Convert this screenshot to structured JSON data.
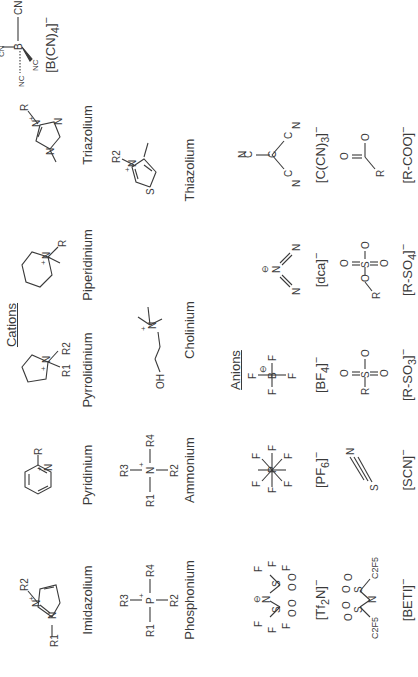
{
  "headers": {
    "cations": "Cations",
    "anions": "Anions"
  },
  "cations": {
    "row1": [
      {
        "name": "Imidazolium"
      },
      {
        "name": "Pyridinium"
      },
      {
        "name": "Pyrrolidinium"
      },
      {
        "name": "Piperidinium"
      },
      {
        "name": "Triazolium"
      }
    ],
    "row2": [
      {
        "name": "Phosphonium"
      },
      {
        "name": "Ammonium"
      },
      {
        "name": "Cholinium"
      },
      {
        "name": "Thiazolium"
      }
    ]
  },
  "anions": {
    "row1": [
      {
        "name": "[Tf2N]⁻",
        "base": "[Tf",
        "sub": "2",
        "rest": "N]",
        "sup": "−"
      },
      {
        "name": "[PF6]⁻",
        "base": "[PF",
        "sub": "6",
        "rest": "]",
        "sup": "−"
      },
      {
        "name": "[BF4]⁻",
        "base": "[BF",
        "sub": "4",
        "rest": "]",
        "sup": "−"
      },
      {
        "name": "[dca]⁻",
        "base": "[dca",
        "sub": "",
        "rest": "]",
        "sup": "−"
      },
      {
        "name": "[C(CN)3]⁻",
        "base": "[C(CN)",
        "sub": "3",
        "rest": "]",
        "sup": "−"
      },
      {
        "name": "[B(CN)4]⁻",
        "base": "[B(CN)",
        "sub": "4",
        "rest": "]",
        "sup": "−"
      }
    ],
    "row2": [
      {
        "name": "[BETI]⁻",
        "base": "[BETI",
        "sub": "",
        "rest": "]",
        "sup": "−"
      },
      {
        "name": "[SCN]⁻",
        "base": "[SCN",
        "sub": "",
        "rest": "]",
        "sup": "−"
      },
      {
        "name": "[R-SO3]⁻",
        "base": "[R-SO",
        "sub": "3",
        "rest": "]",
        "sup": "−"
      },
      {
        "name": "[R-SO4]⁻",
        "base": "[R-SO",
        "sub": "4",
        "rest": "]",
        "sup": "−"
      },
      {
        "name": "[R-COO]⁻",
        "base": "[R-COO",
        "sub": "",
        "rest": "]",
        "sup": "−"
      }
    ]
  },
  "atoms": {
    "R": "R",
    "R1": "R1",
    "R2": "R2",
    "R3": "R3",
    "R4": "R4",
    "N": "N",
    "P": "P",
    "S": "S",
    "O": "O",
    "F": "F",
    "B": "B",
    "C": "C",
    "OH": "OH",
    "CN": "CN",
    "NC": "NC",
    "C2F5": "C2F5",
    "plus": "+",
    "minus": "−",
    "circle_minus": "⊖"
  },
  "colors": {
    "ink": "#3a3a3a",
    "background": "#ffffff"
  }
}
